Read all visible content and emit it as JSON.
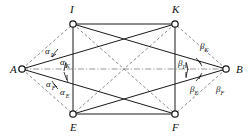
{
  "figure": {
    "background_color": "#ffffff",
    "line_color": "#1a1a1a",
    "dashed_color": "#5a5a5a",
    "axis_color": "#6a6a6a",
    "node_fill": "#ffffff"
  },
  "vertices": [
    {
      "id": "A",
      "label": "A",
      "x": 22,
      "y": 69,
      "label_x": 10,
      "label_y": 73,
      "node": true
    },
    {
      "id": "B",
      "label": "B",
      "x": 226,
      "y": 69,
      "label_x": 236,
      "label_y": 73,
      "node": true
    },
    {
      "id": "I",
      "label": "I",
      "x": 73,
      "y": 24,
      "label_x": 70,
      "label_y": 13,
      "node": true
    },
    {
      "id": "K",
      "label": "K",
      "x": 175,
      "y": 24,
      "label_x": 172,
      "label_y": 13,
      "node": true
    },
    {
      "id": "E",
      "label": "E",
      "x": 73,
      "y": 114,
      "label_x": 70,
      "label_y": 131,
      "node": true
    },
    {
      "id": "F",
      "label": "F",
      "x": 175,
      "y": 114,
      "label_x": 172,
      "label_y": 131,
      "node": true
    }
  ],
  "edges": {
    "rectangle_solid": [
      {
        "from": "I",
        "to": "K"
      },
      {
        "from": "K",
        "to": "F"
      },
      {
        "from": "F",
        "to": "E"
      },
      {
        "from": "E",
        "to": "I"
      }
    ],
    "from_A_solid": [
      {
        "from": "A",
        "to": "K"
      },
      {
        "from": "A",
        "to": "F"
      }
    ],
    "from_A_dashed": [
      {
        "from": "A",
        "to": "I"
      },
      {
        "from": "A",
        "to": "E"
      }
    ],
    "from_B_solid": [
      {
        "from": "B",
        "to": "I"
      },
      {
        "from": "B",
        "to": "E"
      }
    ],
    "from_B_dashed": [
      {
        "from": "B",
        "to": "K"
      },
      {
        "from": "B",
        "to": "F"
      }
    ],
    "diagonals_dashed": [
      {
        "from": "I",
        "to": "F"
      },
      {
        "from": "K",
        "to": "E"
      }
    ],
    "axis_dashdot": [
      {
        "from": "A",
        "to": "B"
      }
    ]
  },
  "angles": [
    {
      "id": "alpha_I",
      "greek": "α",
      "subscript": "I",
      "at": "A",
      "label_x": 45,
      "label_y": 54,
      "sub_dx": 7,
      "sub_dy": 3
    },
    {
      "id": "alpha_K",
      "greek": "α",
      "subscript": "K",
      "at": "A",
      "label_x": 60,
      "label_y": 65,
      "sub_dx": 7,
      "sub_dy": 3
    },
    {
      "id": "alpha_F",
      "greek": "α",
      "subscript": "F",
      "at": "A",
      "label_x": 46,
      "label_y": 87,
      "sub_dx": 7,
      "sub_dy": 3
    },
    {
      "id": "alpha_E",
      "greek": "α",
      "subscript": "E",
      "at": "A",
      "label_x": 60,
      "label_y": 95,
      "sub_dx": 7,
      "sub_dy": 3
    },
    {
      "id": "beta_K",
      "greek": "β",
      "subscript": "K",
      "at": "B",
      "label_x": 200,
      "label_y": 49,
      "sub_dx": 6,
      "sub_dy": 3
    },
    {
      "id": "beta_I",
      "greek": "β",
      "subscript": "I",
      "at": "B",
      "label_x": 178,
      "label_y": 66,
      "sub_dx": 6,
      "sub_dy": 3
    },
    {
      "id": "beta_E",
      "greek": "β",
      "subscript": "E",
      "at": "B",
      "label_x": 190,
      "label_y": 92,
      "sub_dx": 6,
      "sub_dy": 3
    },
    {
      "id": "beta_F",
      "greek": "β",
      "subscript": "F",
      "at": "B",
      "label_x": 216,
      "label_y": 92,
      "sub_dx": 6,
      "sub_dy": 3
    }
  ],
  "angle_arcs": [
    {
      "id": "arc-alpha-I",
      "d": "M 52 57 A 36 36 0 0 1 58 49",
      "tick": "M 52 57 L 56 54"
    },
    {
      "id": "arc-alpha-K",
      "d": "M 64 71 A 44 44 0 0 1 66 62",
      "tick": "M 66 63 L 66 68"
    },
    {
      "id": "arc-alpha-F",
      "d": "M 52 81 A 36 36 0 0 0 58 89",
      "tick": "M 57 87 L 54 84"
    },
    {
      "id": "arc-alpha-E",
      "d": "M 64 72 A 44 44 0 0 0 68 82",
      "tick": "M 67 80 L 67 75"
    },
    {
      "id": "arc-beta-K",
      "d": "M 196 58 A 38 38 0 0 1 202 66",
      "tick": "M 198 60 L 201 64"
    },
    {
      "id": "arc-beta-I",
      "d": "M 186 62 A 46 46 0 0 1 188 70",
      "tick": "M 186 63 L 186 68"
    },
    {
      "id": "arc-beta-F",
      "d": "M 196 81 A 38 38 0 0 0 202 73",
      "tick": "M 199 79 L 201 75"
    },
    {
      "id": "arc-beta-E",
      "d": "M 188 69 A 46 46 0 0 0 186 78",
      "tick": "M 186 77 L 186 72"
    }
  ]
}
